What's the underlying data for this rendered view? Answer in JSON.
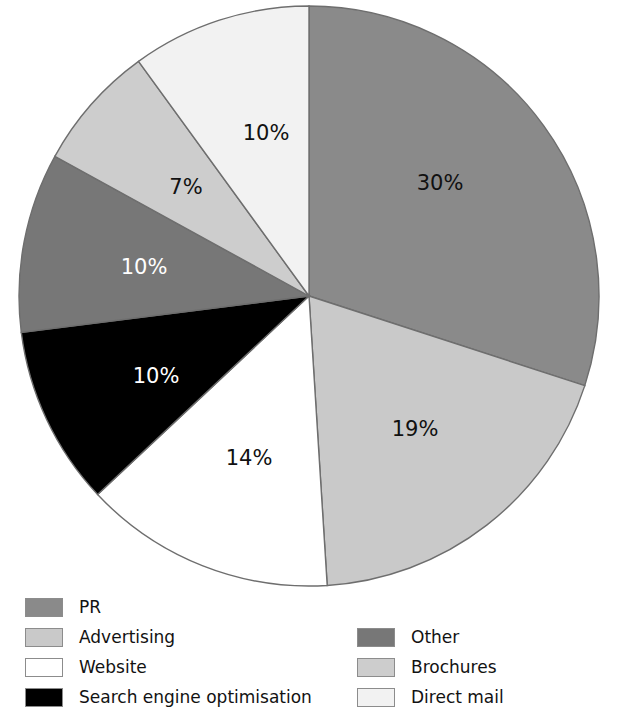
{
  "chart_data": {
    "type": "pie",
    "title": "",
    "subtitle": "",
    "xlabel": "",
    "ylabel": "",
    "legend_position": "bottom",
    "grid": false,
    "categories": [
      "PR",
      "Advertising",
      "Website",
      "Search engine optimisation",
      "Other",
      "Brochures",
      "Direct mail"
    ],
    "values": [
      30,
      19,
      14,
      10,
      10,
      7,
      10
    ],
    "value_labels": [
      "30%",
      "19%",
      "14%",
      "10%",
      "10%",
      "7%",
      "10%"
    ],
    "colors": [
      "#8a8a8a",
      "#c9c9c9",
      "#ffffff",
      "#000000",
      "#777777",
      "#cdcdcd",
      "#f2f2f2"
    ],
    "label_colors": [
      "#111111",
      "#111111",
      "#111111",
      "#ffffff",
      "#ffffff",
      "#111111",
      "#111111"
    ],
    "start_angle_deg": 0,
    "direction": "clockwise",
    "slices": [
      {
        "name": "PR",
        "value": 30,
        "label": "30%",
        "color": "#8a8a8a",
        "label_color": "#111111",
        "label_x": 440,
        "label_y": 184
      },
      {
        "name": "Advertising",
        "value": 19,
        "label": "19%",
        "color": "#c9c9c9",
        "label_color": "#111111",
        "label_x": 415,
        "label_y": 430
      },
      {
        "name": "Website",
        "value": 14,
        "label": "14%",
        "color": "#ffffff",
        "label_color": "#111111",
        "label_x": 249,
        "label_y": 459
      },
      {
        "name": "Search engine optimisation",
        "value": 10,
        "label": "10%",
        "color": "#000000",
        "label_color": "#ffffff",
        "label_x": 156,
        "label_y": 377
      },
      {
        "name": "Other",
        "value": 10,
        "label": "10%",
        "color": "#777777",
        "label_color": "#ffffff",
        "label_x": 144,
        "label_y": 268
      },
      {
        "name": "Brochures",
        "value": 7,
        "label": "7%",
        "color": "#cdcdcd",
        "label_color": "#111111",
        "label_x": 186,
        "label_y": 188
      },
      {
        "name": "Direct mail",
        "value": 10,
        "label": "10%",
        "color": "#f2f2f2",
        "label_color": "#111111",
        "label_x": 266,
        "label_y": 134
      }
    ]
  },
  "pie": {
    "center_x": 309,
    "center_y": 296,
    "radius": 290,
    "stroke": "#6e6e6e"
  },
  "legend": {
    "left_column": [
      {
        "label": "PR",
        "color": "#8a8a8a"
      },
      {
        "label": "Advertising",
        "color": "#c9c9c9"
      },
      {
        "label": "Website",
        "color": "#ffffff"
      },
      {
        "label": "Search engine optimisation",
        "color": "#000000"
      }
    ],
    "right_column": [
      {
        "label": "Other",
        "color": "#777777"
      },
      {
        "label": "Brochures",
        "color": "#cdcdcd"
      },
      {
        "label": "Direct mail",
        "color": "#f2f2f2"
      }
    ]
  }
}
